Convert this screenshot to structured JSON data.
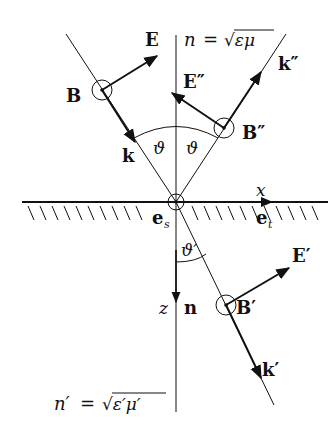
{
  "diagram": {
    "media": {
      "upper": {
        "label": "n = √(εμ)",
        "lhs": "n",
        "eq": "=",
        "rhs": "√εμ"
      },
      "lower": {
        "label": "n′ = √(ε′μ′)",
        "lhs": "n′",
        "eq": "=",
        "rhs": "√ε′μ′"
      }
    },
    "axes": {
      "x": "x",
      "z": "z"
    },
    "unit_vectors": {
      "e_s": "e",
      "e_s_sub": "s",
      "e_t": "e",
      "e_t_sub": "t",
      "n": "n"
    },
    "incident": {
      "k": "k",
      "E": "E",
      "B": "B"
    },
    "reflected": {
      "k": "k″",
      "E": "E″",
      "B": "B″"
    },
    "transmitted": {
      "k": "k′",
      "E": "E′",
      "B": "B′"
    },
    "angles": {
      "incidence": "ϑ",
      "reflection": "ϑ",
      "refraction": "ϑ′"
    },
    "colors": {
      "ink": "#111111",
      "background": "#ffffff"
    }
  }
}
